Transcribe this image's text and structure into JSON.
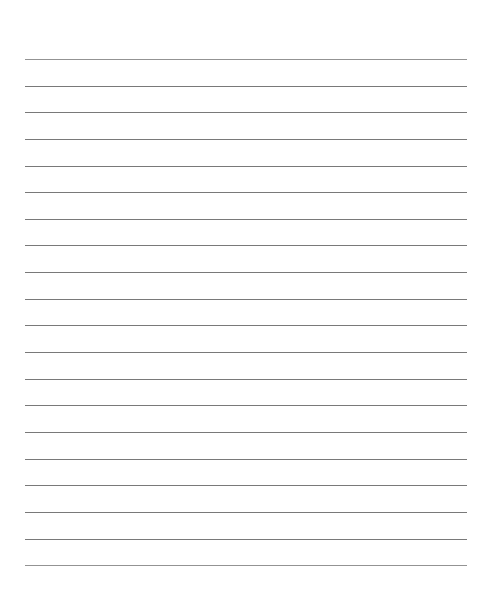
{
  "document": {
    "kind": "lined-paper",
    "title": "Lined Paper Sheet",
    "background_color": "#ffffff",
    "width_px": 488,
    "height_px": 590,
    "text_content": "",
    "header_text": "",
    "footer_text": ""
  },
  "ruling": {
    "line_color": "#6e6e6e",
    "soft_line_color": "#8a8a8a",
    "line_thickness_px": 1,
    "line_count": 20,
    "line_left_px": 25,
    "line_right_px": 467,
    "line_width_px": 442,
    "first_line_y_px": 59,
    "line_spacing_px": 26.6,
    "last_line_y_px": 565,
    "top_margin_px": 59,
    "bottom_margin_px": 25,
    "has_margin_rule": false,
    "lines": [
      {
        "index": 1,
        "y": 59,
        "soft": true
      },
      {
        "index": 2,
        "y": 86,
        "soft": false
      },
      {
        "index": 3,
        "y": 112,
        "soft": false
      },
      {
        "index": 4,
        "y": 139,
        "soft": false
      },
      {
        "index": 5,
        "y": 166,
        "soft": false
      },
      {
        "index": 6,
        "y": 192,
        "soft": false
      },
      {
        "index": 7,
        "y": 219,
        "soft": false
      },
      {
        "index": 8,
        "y": 245,
        "soft": false
      },
      {
        "index": 9,
        "y": 272,
        "soft": false
      },
      {
        "index": 10,
        "y": 299,
        "soft": false
      },
      {
        "index": 11,
        "y": 325,
        "soft": false
      },
      {
        "index": 12,
        "y": 352,
        "soft": false
      },
      {
        "index": 13,
        "y": 379,
        "soft": false
      },
      {
        "index": 14,
        "y": 405,
        "soft": false
      },
      {
        "index": 15,
        "y": 432,
        "soft": false
      },
      {
        "index": 16,
        "y": 459,
        "soft": false
      },
      {
        "index": 17,
        "y": 485,
        "soft": false
      },
      {
        "index": 18,
        "y": 512,
        "soft": false
      },
      {
        "index": 19,
        "y": 539,
        "soft": false
      },
      {
        "index": 20,
        "y": 565,
        "soft": true
      }
    ]
  }
}
